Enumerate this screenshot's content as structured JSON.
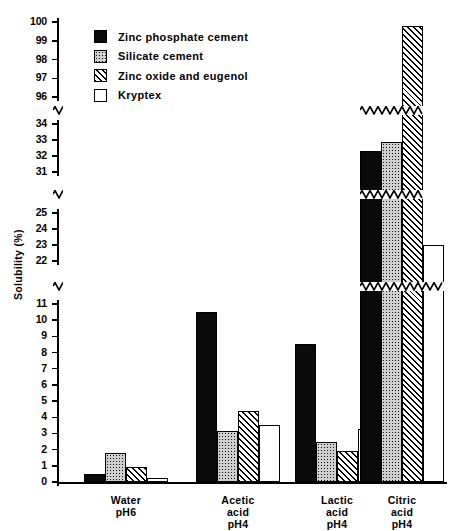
{
  "chart_data": {
    "type": "bar",
    "title": "",
    "xlabel": "",
    "ylabel": "Solubility (%)",
    "categories": [
      "Water pH6",
      "Acetic acid pH4",
      "Lactic acid pH4",
      "Citric acid pH4"
    ],
    "category_lines": [
      [
        "Water",
        "pH6"
      ],
      [
        "Acetic",
        "acid",
        "pH4"
      ],
      [
        "Lactic",
        "acid",
        "pH4"
      ],
      [
        "Citric",
        "acid",
        "pH4"
      ]
    ],
    "series": [
      {
        "name": "Zinc phosphate cement",
        "pattern": "solid",
        "values": [
          0.5,
          10.5,
          8.5,
          32.3
        ]
      },
      {
        "name": "Silicate cement",
        "pattern": "dots",
        "values": [
          1.8,
          3.15,
          2.5,
          32.9
        ]
      },
      {
        "name": "Zinc oxide and eugenol",
        "pattern": "hatch",
        "values": [
          0.9,
          4.4,
          1.9,
          99.8
        ]
      },
      {
        "name": "Kryptex",
        "pattern": "none",
        "values": [
          0.25,
          3.5,
          3.3,
          23.0
        ]
      }
    ],
    "axis_segments": [
      {
        "ticks": [
          96,
          97,
          98,
          99,
          100
        ]
      },
      {
        "ticks": [
          31,
          32,
          33,
          34
        ]
      },
      {
        "ticks": [
          22,
          23,
          24,
          25
        ]
      },
      {
        "ticks": [
          0,
          1,
          2,
          3,
          4,
          5,
          6,
          7,
          8,
          9,
          10,
          11
        ]
      }
    ],
    "grid": false,
    "broken_axis": true,
    "legend_position": "top-left"
  },
  "legend": {
    "items": [
      {
        "label": "Zinc phosphate cement",
        "swatch": "solid-black"
      },
      {
        "label": "Silicate cement",
        "swatch": "stippled"
      },
      {
        "label": "Zinc oxide and eugenol",
        "swatch": "diagonal-hatch"
      },
      {
        "label": "Kryptex",
        "swatch": "white"
      }
    ]
  },
  "axis": {
    "y_title": "Solubility (%)",
    "seg1_ticks": [
      "100",
      "99",
      "98",
      "97",
      "96"
    ],
    "seg2_ticks": [
      "34",
      "33",
      "32",
      "31"
    ],
    "seg3_ticks": [
      "25",
      "24",
      "23",
      "22"
    ],
    "seg4_ticks": [
      "11",
      "10",
      "9",
      "8",
      "7",
      "6",
      "5",
      "4",
      "3",
      "2",
      "1",
      "0"
    ]
  }
}
